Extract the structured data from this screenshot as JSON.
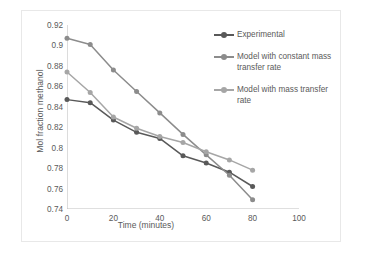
{
  "chart_data": {
    "type": "line",
    "title": "",
    "xlabel": "Time (minutes)",
    "ylabel": "Mol fraction methanol",
    "xlim": [
      0,
      100
    ],
    "ylim": [
      0.74,
      0.92
    ],
    "xticks": [
      "0",
      "20",
      "40",
      "60",
      "80",
      "100"
    ],
    "xtick_values": [
      0,
      20,
      40,
      60,
      80,
      100
    ],
    "yticks": [
      "0.74",
      "0.76",
      "0.78",
      "0.8",
      "0.82",
      "0.84",
      "0.86",
      "0.88",
      "0.9",
      "0.92"
    ],
    "ytick_values": [
      0.74,
      0.76,
      0.78,
      0.8,
      0.82,
      0.84,
      0.86,
      0.88,
      0.9,
      0.92
    ],
    "grid": false,
    "legend_position": "right",
    "x": [
      0,
      10,
      20,
      30,
      40,
      50,
      60,
      70,
      80
    ],
    "series": [
      {
        "name": "Experimental",
        "color": "#595959",
        "marker": "circle",
        "values": [
          0.847,
          0.844,
          0.827,
          0.815,
          0.809,
          0.792,
          0.785,
          0.776,
          0.762
        ]
      },
      {
        "name": "Model with constant mass transfer rate",
        "color": "#8c8c8c",
        "marker": "circle",
        "values": [
          0.907,
          0.901,
          0.876,
          0.855,
          0.834,
          0.813,
          0.793,
          0.773,
          0.749
        ]
      },
      {
        "name": "Model with mass transfer rate",
        "color": "#a6a6a6",
        "marker": "circle",
        "values": [
          0.874,
          0.854,
          0.83,
          0.819,
          0.811,
          0.805,
          0.796,
          0.788,
          0.778
        ]
      }
    ]
  },
  "legend": {
    "entries": [
      {
        "label": "Experimental"
      },
      {
        "label": "Model with constant mass transfer rate"
      },
      {
        "label": "Model with mass transfer rate"
      }
    ]
  },
  "colors": {
    "axis": "#bfbfbf",
    "tick_text": "#5a5a5a",
    "frame": "#e8e8e8",
    "background": "#ffffff"
  }
}
